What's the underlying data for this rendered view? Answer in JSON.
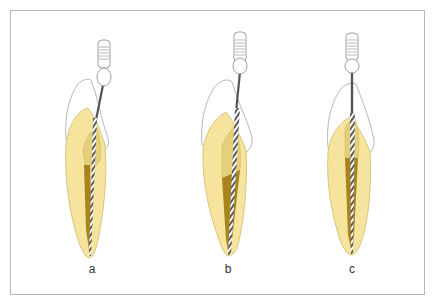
{
  "figure": {
    "panels": [
      {
        "label": "a",
        "description": "file in canal, working portion in coronal third"
      },
      {
        "label": "b",
        "description": "file advanced, mid-canal shaping"
      },
      {
        "label": "c",
        "description": "file at full working length, straight-line access"
      }
    ]
  },
  "colors": {
    "frame": "#b9b9b9",
    "dentin": "#f7e6a0",
    "dentin_outline": "#c9b163",
    "canal_light": "#e6cf7a",
    "canal_dark": "#a8841f",
    "enamel_outline": "#9a9a9a",
    "file_shaft": "#555555",
    "handle_outline": "#888888"
  }
}
